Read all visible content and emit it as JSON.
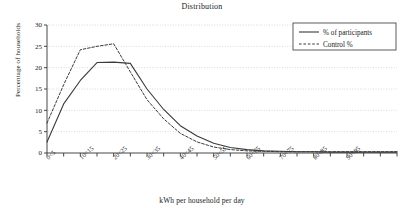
{
  "chart_data": {
    "type": "line",
    "title": "Distribution",
    "xlabel": "kWh per household per day",
    "ylabel": "Percentage of households",
    "grid": true,
    "legend_position": "top-right",
    "ylim": [
      0,
      30
    ],
    "yticks": [
      0,
      5,
      10,
      15,
      20,
      25,
      30
    ],
    "categories": [
      "0<5",
      "5<10",
      "10<15",
      "15<20",
      "20<25",
      "25<30",
      "30<35",
      "35<40",
      "40<45",
      "45<50",
      "50<55",
      "55<60",
      "60<65",
      "65<70",
      "70<75",
      "75<80",
      "80<85",
      "85<90",
      "90<95",
      "95<100",
      "100<105",
      "105<110"
    ],
    "tick_labels": [
      "0<5",
      "",
      "10<15",
      "",
      "20<25",
      "",
      "30<35",
      "",
      "40<45",
      "",
      "50<55",
      "",
      "60<65",
      "",
      "70<75",
      "",
      "80<85",
      "",
      "90<95",
      "",
      "",
      ""
    ],
    "series": [
      {
        "name": "% of participants",
        "style": "solid",
        "color": "#3a3a3a",
        "values": [
          2.6,
          11.5,
          17.0,
          21.2,
          21.3,
          21.0,
          15.0,
          10.2,
          6.4,
          4.0,
          2.3,
          1.3,
          0.8,
          0.5,
          0.4,
          0.3,
          0.3,
          0.2,
          0.2,
          0.2,
          0.2,
          0.2
        ]
      },
      {
        "name": "Control %",
        "style": "dashed",
        "color": "#3a3a3a",
        "values": [
          7.0,
          16.0,
          24.2,
          25.0,
          25.6,
          19.0,
          12.5,
          8.0,
          4.6,
          2.6,
          1.4,
          0.8,
          0.5,
          0.4,
          0.3,
          0.3,
          0.3,
          0.3,
          0.3,
          0.3,
          0.3,
          0.3
        ]
      }
    ]
  },
  "legend": {
    "entries": [
      {
        "label": "% of participants",
        "style": "solid"
      },
      {
        "label": "Control %",
        "style": "dashed"
      }
    ]
  }
}
